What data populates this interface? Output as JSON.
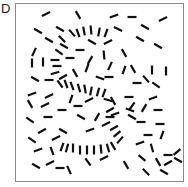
{
  "panel": {
    "label": "D",
    "description": "Contour integration stimulus: field of oriented line segments with embedded S-shaped contour"
  },
  "style": {
    "frame_color": "#8a8a8a",
    "segment_color": "#111111",
    "segment_length": 9
  },
  "segments": [
    {
      "x": 46,
      "y": 14,
      "a": -25
    },
    {
      "x": 78,
      "y": 15,
      "a": 60
    },
    {
      "x": 114,
      "y": 16,
      "a": -20
    },
    {
      "x": 132,
      "y": 17,
      "a": 0
    },
    {
      "x": 163,
      "y": 19,
      "a": -25
    },
    {
      "x": 38,
      "y": 31,
      "a": 30
    },
    {
      "x": 60,
      "y": 29,
      "a": 30
    },
    {
      "x": 72,
      "y": 33,
      "a": 50
    },
    {
      "x": 78,
      "y": 33,
      "a": 70
    },
    {
      "x": 84,
      "y": 31,
      "a": 80
    },
    {
      "x": 91,
      "y": 30,
      "a": 85
    },
    {
      "x": 99,
      "y": 32,
      "a": -80
    },
    {
      "x": 106,
      "y": 33,
      "a": -70
    },
    {
      "x": 118,
      "y": 29,
      "a": 25
    },
    {
      "x": 145,
      "y": 27,
      "a": 30
    },
    {
      "x": 49,
      "y": 40,
      "a": 30
    },
    {
      "x": 62,
      "y": 39,
      "a": 45
    },
    {
      "x": 64,
      "y": 46,
      "a": 30
    },
    {
      "x": 80,
      "y": 50,
      "a": 0
    },
    {
      "x": 92,
      "y": 42,
      "a": 30
    },
    {
      "x": 108,
      "y": 42,
      "a": -25
    },
    {
      "x": 140,
      "y": 39,
      "a": 30
    },
    {
      "x": 158,
      "y": 46,
      "a": 30
    },
    {
      "x": 34,
      "y": 52,
      "a": -65
    },
    {
      "x": 59,
      "y": 52,
      "a": 35
    },
    {
      "x": 70,
      "y": 58,
      "a": 0
    },
    {
      "x": 104,
      "y": 55,
      "a": 85
    },
    {
      "x": 124,
      "y": 53,
      "a": 60
    },
    {
      "x": 32,
      "y": 63,
      "a": 90
    },
    {
      "x": 43,
      "y": 62,
      "a": 90
    },
    {
      "x": 55,
      "y": 60,
      "a": 0
    },
    {
      "x": 57,
      "y": 66,
      "a": 0
    },
    {
      "x": 90,
      "y": 60,
      "a": -60
    },
    {
      "x": 110,
      "y": 66,
      "a": -65
    },
    {
      "x": 133,
      "y": 69,
      "a": 60
    },
    {
      "x": 152,
      "y": 70,
      "a": 90
    },
    {
      "x": 166,
      "y": 71,
      "a": 90
    },
    {
      "x": 55,
      "y": 73,
      "a": -15
    },
    {
      "x": 63,
      "y": 77,
      "a": -30
    },
    {
      "x": 75,
      "y": 73,
      "a": 60
    },
    {
      "x": 87,
      "y": 68,
      "a": -70
    },
    {
      "x": 124,
      "y": 70,
      "a": -70
    },
    {
      "x": 137,
      "y": 83,
      "a": 0
    },
    {
      "x": 35,
      "y": 79,
      "a": 30
    },
    {
      "x": 49,
      "y": 80,
      "a": 0
    },
    {
      "x": 60,
      "y": 84,
      "a": 55
    },
    {
      "x": 66,
      "y": 84,
      "a": 70
    },
    {
      "x": 72,
      "y": 86,
      "a": 70
    },
    {
      "x": 79,
      "y": 88,
      "a": 75
    },
    {
      "x": 85,
      "y": 89,
      "a": 80
    },
    {
      "x": 91,
      "y": 91,
      "a": -80
    },
    {
      "x": 98,
      "y": 92,
      "a": -75
    },
    {
      "x": 104,
      "y": 93,
      "a": -70
    },
    {
      "x": 100,
      "y": 78,
      "a": 20
    },
    {
      "x": 109,
      "y": 77,
      "a": 0
    },
    {
      "x": 146,
      "y": 79,
      "a": 50
    },
    {
      "x": 156,
      "y": 85,
      "a": 35
    },
    {
      "x": 32,
      "y": 94,
      "a": -20
    },
    {
      "x": 49,
      "y": 96,
      "a": -25
    },
    {
      "x": 71,
      "y": 99,
      "a": -70
    },
    {
      "x": 78,
      "y": 106,
      "a": 0
    },
    {
      "x": 89,
      "y": 100,
      "a": -25
    },
    {
      "x": 108,
      "y": 100,
      "a": 15
    },
    {
      "x": 113,
      "y": 101,
      "a": 60
    },
    {
      "x": 129,
      "y": 97,
      "a": 0
    },
    {
      "x": 132,
      "y": 106,
      "a": -55
    },
    {
      "x": 153,
      "y": 98,
      "a": -20
    },
    {
      "x": 30,
      "y": 104,
      "a": 60
    },
    {
      "x": 45,
      "y": 105,
      "a": -25
    },
    {
      "x": 62,
      "y": 110,
      "a": 0
    },
    {
      "x": 110,
      "y": 110,
      "a": -30
    },
    {
      "x": 115,
      "y": 114,
      "a": -20
    },
    {
      "x": 130,
      "y": 110,
      "a": 20
    },
    {
      "x": 144,
      "y": 108,
      "a": -60
    },
    {
      "x": 158,
      "y": 110,
      "a": 0
    },
    {
      "x": 30,
      "y": 120,
      "a": 35
    },
    {
      "x": 48,
      "y": 117,
      "a": 0
    },
    {
      "x": 81,
      "y": 117,
      "a": 30
    },
    {
      "x": 97,
      "y": 117,
      "a": -60
    },
    {
      "x": 110,
      "y": 117,
      "a": 0
    },
    {
      "x": 132,
      "y": 117,
      "a": 30
    },
    {
      "x": 141,
      "y": 122,
      "a": 0
    },
    {
      "x": 160,
      "y": 124,
      "a": 0
    },
    {
      "x": 42,
      "y": 131,
      "a": -30
    },
    {
      "x": 63,
      "y": 131,
      "a": 30
    },
    {
      "x": 90,
      "y": 130,
      "a": -20
    },
    {
      "x": 106,
      "y": 124,
      "a": -25
    },
    {
      "x": 114,
      "y": 128,
      "a": -30
    },
    {
      "x": 117,
      "y": 134,
      "a": -40
    },
    {
      "x": 120,
      "y": 140,
      "a": -50
    },
    {
      "x": 148,
      "y": 135,
      "a": 0
    },
    {
      "x": 162,
      "y": 135,
      "a": -70
    },
    {
      "x": 32,
      "y": 140,
      "a": 35
    },
    {
      "x": 56,
      "y": 138,
      "a": -25
    },
    {
      "x": 62,
      "y": 147,
      "a": -70
    },
    {
      "x": 67,
      "y": 148,
      "a": -75
    },
    {
      "x": 73,
      "y": 148,
      "a": 90
    },
    {
      "x": 80,
      "y": 150,
      "a": 90
    },
    {
      "x": 87,
      "y": 150,
      "a": 90
    },
    {
      "x": 94,
      "y": 150,
      "a": 90
    },
    {
      "x": 101,
      "y": 149,
      "a": 85
    },
    {
      "x": 108,
      "y": 148,
      "a": 75
    },
    {
      "x": 113,
      "y": 146,
      "a": 60
    },
    {
      "x": 140,
      "y": 143,
      "a": -20
    },
    {
      "x": 152,
      "y": 148,
      "a": 75
    },
    {
      "x": 177,
      "y": 152,
      "a": -40
    },
    {
      "x": 38,
      "y": 150,
      "a": -20
    },
    {
      "x": 52,
      "y": 151,
      "a": 70
    },
    {
      "x": 142,
      "y": 158,
      "a": 40
    },
    {
      "x": 158,
      "y": 162,
      "a": 60
    },
    {
      "x": 168,
      "y": 155,
      "a": 0
    },
    {
      "x": 36,
      "y": 166,
      "a": 30
    },
    {
      "x": 50,
      "y": 163,
      "a": -25
    },
    {
      "x": 69,
      "y": 170,
      "a": 65
    },
    {
      "x": 88,
      "y": 162,
      "a": 55
    },
    {
      "x": 104,
      "y": 158,
      "a": -25
    },
    {
      "x": 126,
      "y": 165,
      "a": 60
    },
    {
      "x": 146,
      "y": 172,
      "a": 45
    },
    {
      "x": 164,
      "y": 172,
      "a": 30
    },
    {
      "x": 168,
      "y": 163,
      "a": -30
    },
    {
      "x": 60,
      "y": 168,
      "a": 0
    },
    {
      "x": 178,
      "y": 160,
      "a": 30
    }
  ]
}
